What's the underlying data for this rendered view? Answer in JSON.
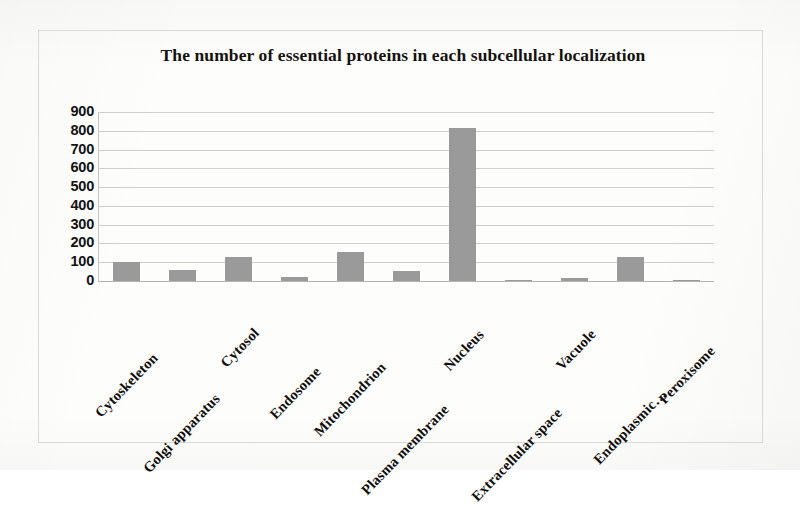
{
  "chart_data": {
    "type": "bar",
    "title": "The number of essential proteins in each subcellular localization",
    "xlabel": "",
    "ylabel": "",
    "ylim": [
      0,
      900
    ],
    "ytick_step": 100,
    "grid": true,
    "legend": "none",
    "bar_color": "#9a9a9a",
    "categories": [
      "Cytoskeleton",
      "Golgi apparatus",
      "Cytosol",
      "Endosome",
      "Mitochondrion",
      "Plasma membrane",
      "Nucleus",
      "Extracellular space",
      "Vacuole",
      "Endoplasmic…",
      "Peroxisome"
    ],
    "values": [
      100,
      60,
      130,
      20,
      155,
      55,
      815,
      2,
      18,
      130,
      2
    ],
    "ytick_labels": [
      "900",
      "800",
      "700",
      "600",
      "500",
      "400",
      "300",
      "200",
      "100",
      "0"
    ],
    "ytick_values": [
      900,
      800,
      700,
      600,
      500,
      400,
      300,
      200,
      100,
      0
    ]
  },
  "figure": {
    "background_color": "#fdfdfc",
    "frame_color": "#d9d9d6",
    "gridline_color": "#cfcfcc",
    "text_color": "#121212"
  }
}
